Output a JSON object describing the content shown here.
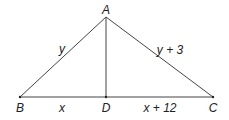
{
  "diagram": {
    "type": "geometry-triangle",
    "colors": {
      "line": "#444444",
      "text": "#222222",
      "background": "#ffffff"
    },
    "vertices": {
      "A": {
        "label": "A",
        "x": 106,
        "y": 17
      },
      "B": {
        "label": "B",
        "x": 20,
        "y": 97
      },
      "C": {
        "label": "C",
        "x": 213,
        "y": 97
      },
      "D": {
        "label": "D",
        "x": 106,
        "y": 97
      }
    },
    "segments": {
      "AB": {
        "label": "y"
      },
      "AC": {
        "label": "y + 3"
      },
      "BD": {
        "label": "x"
      },
      "DC": {
        "label": "x + 12"
      },
      "AD": {
        "label": ""
      }
    }
  }
}
